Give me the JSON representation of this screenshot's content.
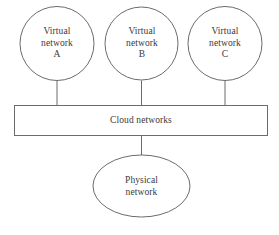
{
  "diagram": {
    "type": "block-diagram",
    "background_color": "#ffffff",
    "stroke_color": "#6b6b6b",
    "text_color": "#3a3a3a",
    "nodes": [
      {
        "id": "virtual-network-a",
        "shape": "circle",
        "label": "Virtual\nnetwork\nA",
        "cx": 57,
        "cy": 43.5,
        "r": 37
      },
      {
        "id": "virtual-network-b",
        "shape": "circle",
        "label": "Virtual\nnetwork\nB",
        "cx": 141.5,
        "cy": 43.5,
        "r": 36.5
      },
      {
        "id": "virtual-network-c",
        "shape": "circle",
        "label": "Virtual\nnetwork\nC",
        "cx": 225,
        "cy": 43.5,
        "r": 37
      },
      {
        "id": "cloud-networks",
        "shape": "rectangle",
        "label": "Cloud networks",
        "x": 14,
        "y": 105,
        "width": 254,
        "height": 31
      },
      {
        "id": "physical-network",
        "shape": "ellipse",
        "label": "Physical\nnetwork",
        "cx": 141.5,
        "cy": 186,
        "rx": 48.5,
        "ry": 31
      }
    ],
    "edges": [
      {
        "id": "edge-vn-a-to-cloud",
        "from": "virtual-network-a",
        "to": "cloud-networks",
        "x1": 57,
        "y1": 80.5,
        "x2": 57,
        "y2": 105
      },
      {
        "id": "edge-vn-b-to-cloud",
        "from": "virtual-network-b",
        "to": "cloud-networks",
        "x1": 141.5,
        "y1": 80.5,
        "x2": 141.5,
        "y2": 105
      },
      {
        "id": "edge-vn-c-to-cloud",
        "from": "virtual-network-c",
        "to": "cloud-networks",
        "x1": 225,
        "y1": 80.5,
        "x2": 225,
        "y2": 105
      },
      {
        "id": "edge-cloud-to-physical",
        "from": "cloud-networks",
        "to": "physical-network",
        "x1": 141.5,
        "y1": 136,
        "x2": 141.5,
        "y2": 156
      }
    ]
  }
}
